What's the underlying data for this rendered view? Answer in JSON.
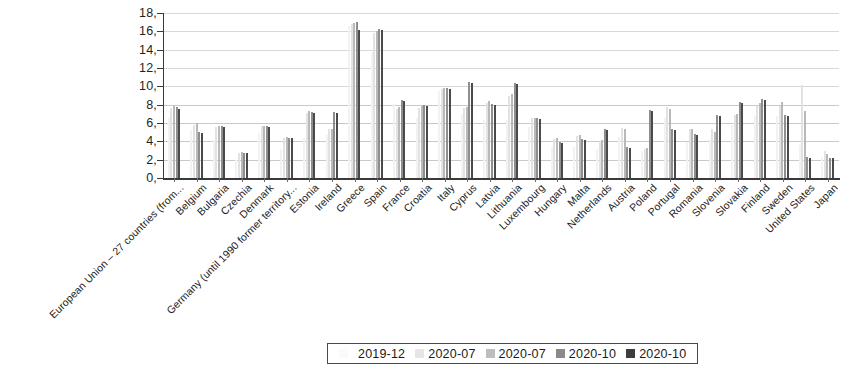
{
  "chart_data": {
    "type": "bar",
    "title": "",
    "subtitle": "",
    "xlabel": "",
    "ylabel": "",
    "ylim": [
      0,
      18
    ],
    "ytick_labels": [
      "18,",
      "16,",
      "14,",
      "12,",
      "10,",
      "8,",
      "6,",
      "4,",
      "2,",
      "0,"
    ],
    "ytick_values": [
      18,
      16,
      14,
      12,
      10,
      8,
      6,
      4,
      2,
      0
    ],
    "grid": true,
    "legend_position": "bottom-center",
    "categories": [
      "European Union – 27 countries (from...",
      "Belgium",
      "Bulgaria",
      "Czechia",
      "Denmark",
      "Germany (until 1990 former territory...",
      "Estonia",
      "Ireland",
      "Greece",
      "Spain",
      "France",
      "Croatia",
      "Italy",
      "Cyprus",
      "Latvia",
      "Lithuania",
      "Luxembourg",
      "Hungary",
      "Malta",
      "Netherlands",
      "Austria",
      "Poland",
      "Portugal",
      "Romania",
      "Slovenia",
      "Slovakia",
      "Finland",
      "Sweden",
      "United States",
      "Japan"
    ],
    "series": [
      {
        "name": "2019-12",
        "color": "#fafafa",
        "values": [
          6.6,
          5.2,
          4.1,
          2.0,
          4.9,
          3.2,
          4.4,
          4.7,
          16.6,
          13.7,
          8.1,
          6.6,
          9.5,
          7.0,
          6.3,
          6.3,
          5.6,
          3.4,
          3.4,
          3.2,
          4.5,
          2.9,
          6.6,
          3.9,
          4.3,
          5.8,
          6.8,
          6.8,
          3.6,
          2.2
        ]
      },
      {
        "name": "2020-07",
        "color": "#e6e6e6",
        "values": [
          7.6,
          5.8,
          5.6,
          2.7,
          5.7,
          4.4,
          7.1,
          5.3,
          16.8,
          15.8,
          7.5,
          7.6,
          9.7,
          7.6,
          8.2,
          9.0,
          6.6,
          4.3,
          4.6,
          4.0,
          5.5,
          3.2,
          7.7,
          5.4,
          5.4,
          6.9,
          7.9,
          7.9,
          10.2,
          2.9
        ]
      },
      {
        "name": "2020-07",
        "color": "#bdbdbd",
        "values": [
          7.9,
          6.0,
          5.7,
          2.8,
          5.7,
          4.5,
          7.3,
          5.4,
          16.9,
          16.0,
          7.8,
          7.9,
          9.8,
          7.8,
          8.4,
          9.2,
          6.5,
          4.4,
          4.7,
          4.1,
          5.4,
          3.3,
          7.5,
          5.3,
          5.0,
          7.0,
          8.2,
          8.3,
          7.3,
          2.6
        ]
      },
      {
        "name": "2020-10",
        "color": "#8a8a8a",
        "values": [
          7.7,
          5.0,
          5.7,
          2.7,
          5.7,
          4.4,
          7.2,
          7.2,
          17.0,
          16.3,
          8.5,
          8.0,
          9.8,
          10.5,
          8.1,
          10.4,
          6.5,
          3.9,
          4.3,
          5.3,
          3.4,
          7.4,
          5.3,
          4.8,
          6.9,
          8.3,
          8.6,
          6.9,
          2.3,
          2.2
        ]
      },
      {
        "name": "2020-10",
        "color": "#3d3d3d",
        "values": [
          7.5,
          4.9,
          5.6,
          2.7,
          5.6,
          4.4,
          7.1,
          7.1,
          16.2,
          16.2,
          8.4,
          7.9,
          9.7,
          10.4,
          8.0,
          10.3,
          6.4,
          3.8,
          4.2,
          5.2,
          3.3,
          7.3,
          5.2,
          4.7,
          6.8,
          8.2,
          8.5,
          6.8,
          2.2,
          2.2
        ]
      }
    ]
  },
  "legend": {
    "entries": [
      {
        "label": "2019-12",
        "swatch": "s0"
      },
      {
        "label": "2020-07",
        "swatch": "s1"
      },
      {
        "label": "2020-07",
        "swatch": "s2"
      },
      {
        "label": "2020-10",
        "swatch": "s3"
      },
      {
        "label": "2020-10",
        "swatch": "s4"
      }
    ]
  }
}
